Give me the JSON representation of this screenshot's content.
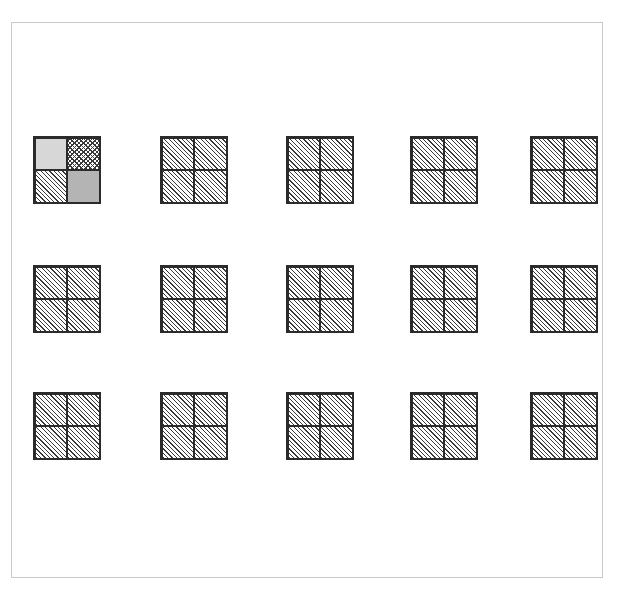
{
  "figure": {
    "title": "",
    "background_color": "#ffffff",
    "frame_color": "#c9c9c9",
    "rule_color": "#2b2b2b",
    "frame": {
      "x": 11,
      "y": 22,
      "width": 592,
      "height": 556
    }
  },
  "palette": {
    "hatch_line": "#3a3a3a",
    "light_gray": "#d7d7d7",
    "medium_gray": "#b4b4b4",
    "white": "#ffffff"
  },
  "legend": {
    "fill_names": [
      "hatch",
      "crosshatch",
      "light",
      "medium"
    ]
  },
  "chart_data": {
    "type": "heatmap",
    "title": "",
    "subtitle": "",
    "xlabel": "",
    "ylabel": "",
    "grid": false,
    "legend_position": "none",
    "rows": 3,
    "columns": 5,
    "cell_size": 68,
    "quadrant_order": [
      "top-left",
      "top-right",
      "bottom-left",
      "bottom-right"
    ],
    "column_x": [
      33,
      160,
      286,
      410,
      530
    ],
    "row_y": [
      136,
      265,
      392
    ],
    "cells": [
      {
        "row": 0,
        "col": 0,
        "x": 33,
        "y": 136,
        "size": 68,
        "quadrants": [
          "light",
          "crosshatch",
          "hatch",
          "medium"
        ]
      },
      {
        "row": 0,
        "col": 1,
        "x": 160,
        "y": 136,
        "size": 68,
        "quadrants": [
          "hatch",
          "hatch",
          "hatch",
          "hatch"
        ]
      },
      {
        "row": 0,
        "col": 2,
        "x": 286,
        "y": 136,
        "size": 68,
        "quadrants": [
          "hatch",
          "hatch",
          "hatch",
          "hatch"
        ]
      },
      {
        "row": 0,
        "col": 3,
        "x": 410,
        "y": 136,
        "size": 68,
        "quadrants": [
          "hatch",
          "hatch",
          "hatch",
          "hatch"
        ]
      },
      {
        "row": 0,
        "col": 4,
        "x": 530,
        "y": 136,
        "size": 68,
        "quadrants": [
          "hatch",
          "hatch",
          "hatch",
          "hatch"
        ]
      },
      {
        "row": 1,
        "col": 0,
        "x": 33,
        "y": 265,
        "size": 68,
        "quadrants": [
          "hatch",
          "hatch",
          "hatch",
          "hatch"
        ]
      },
      {
        "row": 1,
        "col": 1,
        "x": 160,
        "y": 265,
        "size": 68,
        "quadrants": [
          "hatch",
          "hatch",
          "hatch",
          "hatch"
        ]
      },
      {
        "row": 1,
        "col": 2,
        "x": 286,
        "y": 265,
        "size": 68,
        "quadrants": [
          "hatch",
          "hatch",
          "hatch",
          "hatch"
        ]
      },
      {
        "row": 1,
        "col": 3,
        "x": 410,
        "y": 265,
        "size": 68,
        "quadrants": [
          "hatch",
          "hatch",
          "hatch",
          "hatch"
        ]
      },
      {
        "row": 1,
        "col": 4,
        "x": 530,
        "y": 265,
        "size": 68,
        "quadrants": [
          "hatch",
          "hatch",
          "hatch",
          "hatch"
        ]
      },
      {
        "row": 2,
        "col": 0,
        "x": 33,
        "y": 392,
        "size": 68,
        "quadrants": [
          "hatch",
          "hatch",
          "hatch",
          "hatch"
        ]
      },
      {
        "row": 2,
        "col": 1,
        "x": 160,
        "y": 392,
        "size": 68,
        "quadrants": [
          "hatch",
          "hatch",
          "hatch",
          "hatch"
        ]
      },
      {
        "row": 2,
        "col": 2,
        "x": 286,
        "y": 392,
        "size": 68,
        "quadrants": [
          "hatch",
          "hatch",
          "hatch",
          "hatch"
        ]
      },
      {
        "row": 2,
        "col": 3,
        "x": 410,
        "y": 392,
        "size": 68,
        "quadrants": [
          "hatch",
          "hatch",
          "hatch",
          "hatch"
        ]
      },
      {
        "row": 2,
        "col": 4,
        "x": 530,
        "y": 392,
        "size": 68,
        "quadrants": [
          "hatch",
          "hatch",
          "hatch",
          "hatch"
        ]
      }
    ]
  }
}
